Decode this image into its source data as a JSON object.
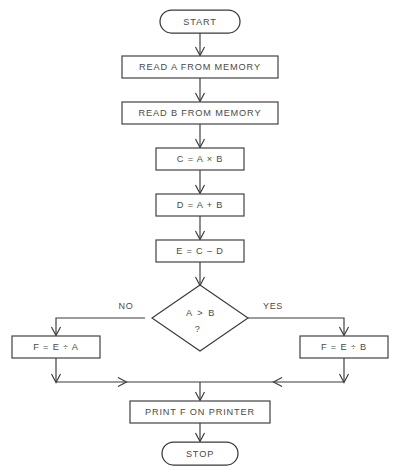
{
  "diagram": {
    "background_color": "#ffffff",
    "line_color": "#3a3a3a",
    "text_color": "#4a4a4a"
  },
  "nodes": {
    "start": {
      "label": "START",
      "type": "terminator"
    },
    "read_a": {
      "label": "READ A FROM MEMORY",
      "type": "process"
    },
    "read_b": {
      "label": "READ B FROM MEMORY",
      "type": "process"
    },
    "compute_c": {
      "label": "C = A × B",
      "type": "process"
    },
    "compute_d": {
      "label": "D = A + B",
      "type": "process"
    },
    "compute_e": {
      "label": "E = C – D",
      "type": "process"
    },
    "decision": {
      "label_line1": "A  >  B",
      "label_line2": "?",
      "type": "decision"
    },
    "branch_no": {
      "label": "F = E ÷ A",
      "type": "process"
    },
    "branch_yes": {
      "label": "F = E ÷ B",
      "type": "process"
    },
    "print": {
      "label": "PRINT F ON PRINTER",
      "type": "process"
    },
    "stop": {
      "label": "STOP",
      "type": "terminator"
    }
  },
  "branches": {
    "no_label": "NO",
    "yes_label": "YES"
  }
}
